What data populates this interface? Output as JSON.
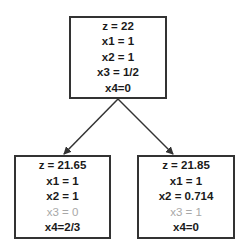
{
  "tree": {
    "root": {
      "lines": [
        {
          "text": "z = 22",
          "muted": false
        },
        {
          "text": "x1 = 1",
          "muted": false
        },
        {
          "text": "x2 = 1",
          "muted": false
        },
        {
          "text": "x3 = 1/2",
          "muted": false
        },
        {
          "text": "x4=0",
          "muted": false
        }
      ]
    },
    "left": {
      "lines": [
        {
          "text": "z = 21.65",
          "muted": false
        },
        {
          "text": "x1 = 1",
          "muted": false
        },
        {
          "text": "x2 = 1",
          "muted": false
        },
        {
          "text": "x3 = 0",
          "muted": true
        },
        {
          "text": "x4=2/3",
          "muted": false
        }
      ]
    },
    "right": {
      "lines": [
        {
          "text": "z = 21.85",
          "muted": false
        },
        {
          "text": "x1 = 1",
          "muted": false
        },
        {
          "text": "x2 = 0.714",
          "muted": false
        },
        {
          "text": "x3 = 1",
          "muted": true
        },
        {
          "text": "x4=0",
          "muted": false
        }
      ]
    }
  },
  "colors": {
    "border": "#333333",
    "text": "#1a1a1a",
    "muted_text": "#a8a8a8",
    "edge": "#333333"
  }
}
